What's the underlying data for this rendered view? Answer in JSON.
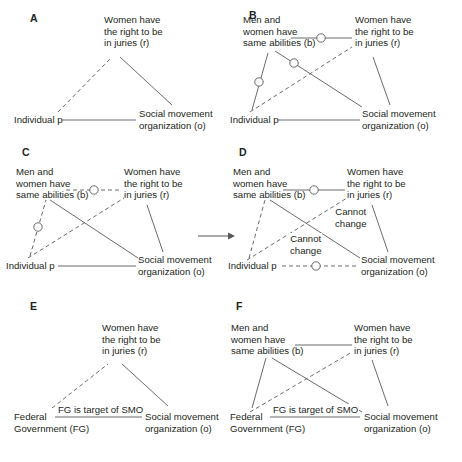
{
  "figure": {
    "background": "#ffffff",
    "ink": "#231f20",
    "line_color": "#58595b",
    "panels": [
      {
        "id": "A",
        "letter": "A",
        "letter_pos": [
          30,
          18
        ],
        "nodes": [
          {
            "key": "r",
            "lines": [
              "Women have",
              "the right to be",
              "in juries (r)"
            ],
            "x": 108,
            "y": 18,
            "align": "left"
          },
          {
            "key": "p",
            "lines": [
              "Individual p"
            ],
            "x": 18,
            "y": 116,
            "align": "left"
          },
          {
            "key": "o",
            "lines": [
              "Social movement",
              "organization (o)"
            ],
            "x": 140,
            "y": 110,
            "align": "left"
          }
        ],
        "edges": [
          {
            "from": "p",
            "to": "r",
            "style": "dashed",
            "marker": "none"
          },
          {
            "from": "r",
            "to": "o",
            "style": "solid",
            "marker": "none"
          },
          {
            "from": "p",
            "to": "o",
            "style": "solid",
            "marker": "none"
          }
        ],
        "edge_labels": []
      },
      {
        "id": "B",
        "letter": "B",
        "letter_pos": [
          249,
          15
        ],
        "nodes": [
          {
            "key": "b",
            "lines": [
              "Men and",
              "women have",
              "same abilities (b)"
            ],
            "x": 245,
            "y": 18,
            "align": "left"
          },
          {
            "key": "r",
            "lines": [
              "Women have",
              "the right to be",
              "in juries (r)"
            ],
            "x": 355,
            "y": 18,
            "align": "left"
          },
          {
            "key": "p",
            "lines": [
              "Individual p"
            ],
            "x": 232,
            "y": 116,
            "align": "left"
          },
          {
            "key": "o",
            "lines": [
              "Social movement",
              "organization (o)"
            ],
            "x": 363,
            "y": 110,
            "align": "left"
          }
        ],
        "edges": [
          {
            "from": "b",
            "to": "r",
            "style": "solid",
            "marker": "circle"
          },
          {
            "from": "p",
            "to": "b",
            "style": "solid",
            "marker": "circle"
          },
          {
            "from": "b",
            "to": "o",
            "style": "solid",
            "marker": "circle"
          },
          {
            "from": "p",
            "to": "r",
            "style": "dashed",
            "marker": "none"
          },
          {
            "from": "r",
            "to": "o",
            "style": "solid",
            "marker": "none"
          },
          {
            "from": "p",
            "to": "o",
            "style": "solid",
            "marker": "none"
          }
        ],
        "edge_labels": []
      },
      {
        "id": "C",
        "letter": "C",
        "letter_pos": [
          22,
          152
        ],
        "nodes": [
          {
            "key": "b",
            "lines": [
              "Men and",
              "women have",
              "same abilities (b)"
            ],
            "x": 18,
            "y": 170,
            "align": "left"
          },
          {
            "key": "r",
            "lines": [
              "Women have",
              "the right to be",
              "in juries (r)"
            ],
            "x": 125,
            "y": 170,
            "align": "left"
          },
          {
            "key": "p",
            "lines": [
              "Individual p"
            ],
            "x": 8,
            "y": 262,
            "align": "left"
          },
          {
            "key": "o",
            "lines": [
              "Social movement",
              "organization (o)"
            ],
            "x": 138,
            "y": 256,
            "align": "left"
          }
        ],
        "edges": [
          {
            "from": "b",
            "to": "r",
            "style": "dashed",
            "marker": "circle"
          },
          {
            "from": "p",
            "to": "b",
            "style": "dashed",
            "marker": "circle"
          },
          {
            "from": "b",
            "to": "o",
            "style": "solid",
            "marker": "none"
          },
          {
            "from": "p",
            "to": "r",
            "style": "dashed",
            "marker": "none"
          },
          {
            "from": "r",
            "to": "o",
            "style": "solid",
            "marker": "none"
          },
          {
            "from": "p",
            "to": "o",
            "style": "solid",
            "marker": "none"
          }
        ],
        "edge_labels": []
      },
      {
        "id": "D",
        "letter": "D",
        "letter_pos": [
          239,
          152
        ],
        "nodes": [
          {
            "key": "b",
            "lines": [
              "Men and",
              "women have",
              "same abilities (b)"
            ],
            "x": 235,
            "y": 170,
            "align": "left"
          },
          {
            "key": "r",
            "lines": [
              "Women have",
              "the right to be",
              "in juries (r)"
            ],
            "x": 348,
            "y": 170,
            "align": "left"
          },
          {
            "key": "p",
            "lines": [
              "Individual p"
            ],
            "x": 230,
            "y": 262,
            "align": "left"
          },
          {
            "key": "o",
            "lines": [
              "Social movement",
              "organization (o)"
            ],
            "x": 363,
            "y": 256,
            "align": "left"
          }
        ],
        "edges": [
          {
            "from": "b",
            "to": "r",
            "style": "solid",
            "marker": "circle"
          },
          {
            "from": "p",
            "to": "b",
            "style": "dashed",
            "marker": "none"
          },
          {
            "from": "b",
            "to": "o",
            "style": "solid",
            "marker": "none"
          },
          {
            "from": "p",
            "to": "r",
            "style": "dashed",
            "marker": "none"
          },
          {
            "from": "r",
            "to": "o",
            "style": "solid",
            "marker": "none"
          },
          {
            "from": "p",
            "to": "o",
            "style": "dashed",
            "marker": "circle"
          }
        ],
        "edge_labels": [
          {
            "text": "Cannot change",
            "lines": [
              "Cannot",
              "change"
            ],
            "x": 339,
            "y": 212
          },
          {
            "text": "Cannot change",
            "lines": [
              "Cannot",
              "change"
            ],
            "x": 295,
            "y": 238
          }
        ]
      },
      {
        "id": "E",
        "letter": "E",
        "letter_pos": [
          30,
          306
        ],
        "nodes": [
          {
            "key": "r",
            "lines": [
              "Women have",
              "the right to be",
              "in juries (r)"
            ],
            "x": 104,
            "y": 325,
            "align": "left"
          },
          {
            "key": "fg",
            "lines": [
              "Federal",
              "Government (FG)"
            ],
            "x": 18,
            "y": 412,
            "align": "left"
          },
          {
            "key": "o",
            "lines": [
              "Social movement",
              "organization (o)"
            ],
            "x": 146,
            "y": 412,
            "align": "left"
          }
        ],
        "edges": [
          {
            "from": "fg",
            "to": "r",
            "style": "dashed",
            "marker": "none"
          },
          {
            "from": "r",
            "to": "o",
            "style": "solid",
            "marker": "none"
          },
          {
            "from": "fg",
            "to": "o",
            "style": "solid",
            "marker": "none"
          }
        ],
        "edge_labels": [
          {
            "text": "FG is target of SMO",
            "lines": [
              "FG is target of SMO"
            ],
            "x": 58,
            "y": 404
          }
        ]
      },
      {
        "id": "F",
        "letter": "F",
        "letter_pos": [
          236,
          306
        ],
        "nodes": [
          {
            "key": "b",
            "lines": [
              "Men and",
              "women have",
              "same abilities (b)"
            ],
            "x": 232,
            "y": 325,
            "align": "left"
          },
          {
            "key": "r",
            "lines": [
              "Women have",
              "the right to be",
              "in juries (r)"
            ],
            "x": 355,
            "y": 325,
            "align": "left"
          },
          {
            "key": "fg",
            "lines": [
              "Federal",
              "Government (FG)"
            ],
            "x": 232,
            "y": 412,
            "align": "left"
          },
          {
            "key": "o",
            "lines": [
              "Social movement",
              "organization (o)"
            ],
            "x": 365,
            "y": 412,
            "align": "left"
          }
        ],
        "edges": [
          {
            "from": "b",
            "to": "r",
            "style": "solid",
            "marker": "none"
          },
          {
            "from": "fg",
            "to": "b",
            "style": "solid",
            "marker": "none"
          },
          {
            "from": "b",
            "to": "o",
            "style": "solid",
            "marker": "none"
          },
          {
            "from": "fg",
            "to": "r",
            "style": "dashed",
            "marker": "none"
          },
          {
            "from": "r",
            "to": "o",
            "style": "solid",
            "marker": "none"
          },
          {
            "from": "fg",
            "to": "o",
            "style": "solid",
            "marker": "none"
          }
        ],
        "edge_labels": [
          {
            "text": "FG is target of SMO",
            "lines": [
              "FG is target of SMO"
            ],
            "x": 272,
            "y": 404
          }
        ]
      }
    ],
    "transition_arrow": {
      "from_panel": "C",
      "to_panel": "D",
      "x1": 198,
      "y1": 236,
      "x2": 232,
      "y2": 236
    }
  }
}
